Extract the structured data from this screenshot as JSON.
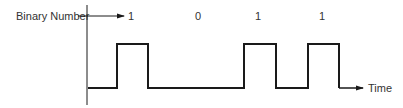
{
  "diagram": {
    "labels": {
      "binary_number": "Binary Number",
      "time": "Time"
    },
    "bits": [
      {
        "value": "1",
        "x": 131
      },
      {
        "value": "0",
        "x": 198
      },
      {
        "value": "1",
        "x": 258
      },
      {
        "value": "1",
        "x": 322
      }
    ],
    "waveform": {
      "low_y": 88,
      "high_y": 44,
      "pulses": [
        {
          "rise_x": 117,
          "fall_x": 148
        },
        {
          "rise_x": 244,
          "fall_x": 276
        },
        {
          "rise_x": 308,
          "fall_x": 339
        }
      ],
      "start_x": 88,
      "end_x": 362
    },
    "colors": {
      "line": "#1a1a1a",
      "text": "#333333",
      "background": "#ffffff"
    }
  }
}
